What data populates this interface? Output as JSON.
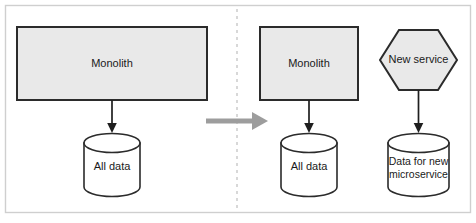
{
  "figure": {
    "frame": {
      "border_color": "#cfcfcf",
      "background_color": "#ffffff"
    },
    "divider": {
      "name": "dashed-vertical-divider",
      "color": "#c8c8c8",
      "style": "dashed"
    },
    "transform_arrow": {
      "name": "transition-arrow",
      "label": "",
      "color": "#9d9d9d",
      "direction": "left-to-right"
    }
  },
  "before": {
    "panel_label": "before-state",
    "monolith": {
      "label": "Monolith",
      "shape": "rectangle",
      "fill": "#e9e9e9",
      "stroke": "#2b2b2b"
    },
    "database": {
      "label": "All data",
      "shape": "cylinder",
      "fill": "#ffffff",
      "stroke": "#2b2b2b"
    },
    "connector": {
      "name": "monolith-to-all-data-arrow",
      "from": "Monolith",
      "to": "All data"
    }
  },
  "after": {
    "panel_label": "after-state",
    "monolith": {
      "label": "Monolith",
      "shape": "rectangle",
      "fill": "#e9e9e9",
      "stroke": "#2b2b2b"
    },
    "database": {
      "label": "All data",
      "shape": "cylinder",
      "fill": "#ffffff",
      "stroke": "#2b2b2b"
    },
    "new_service": {
      "label": "New service",
      "shape": "hexagon",
      "fill": "#e9e9e9",
      "stroke": "#2b2b2b"
    },
    "new_database": {
      "label_line1": "Data for new",
      "label_line2": "microservice",
      "shape": "cylinder",
      "fill": "#ffffff",
      "stroke": "#2b2b2b"
    },
    "connectors": [
      {
        "name": "monolith-to-all-data-arrow",
        "from": "Monolith",
        "to": "All data"
      },
      {
        "name": "new-service-to-new-data-arrow",
        "from": "New service",
        "to": "Data for new microservice"
      }
    ]
  }
}
